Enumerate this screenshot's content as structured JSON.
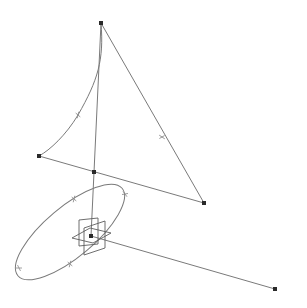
{
  "diagram": {
    "type": "3d-wireframe",
    "width": 307,
    "height": 308,
    "colors": {
      "background": "#ffffff",
      "edge": "#7a7a7a",
      "vertex": "#2a2a2a",
      "gizmo": "#5e5e5e"
    },
    "vertices": [
      {
        "id": "top",
        "x": 101,
        "y": 23
      },
      {
        "id": "left",
        "x": 39,
        "y": 156
      },
      {
        "id": "mid",
        "x": 94,
        "y": 172
      },
      {
        "id": "right",
        "x": 204,
        "y": 203
      },
      {
        "id": "origin",
        "x": 91,
        "y": 236
      },
      {
        "id": "far",
        "x": 275,
        "y": 289
      }
    ],
    "edges": [
      {
        "id": "curve-top-left",
        "d": "M101,23 C104,60 98,80 78,115 C66,135 50,150 39,156"
      },
      {
        "id": "line-top-right",
        "d": "M101,23 L204,203"
      },
      {
        "id": "line-left-right",
        "d": "M39,156 L204,203"
      },
      {
        "id": "line-top-origin",
        "d": "M101,23 L91,236"
      },
      {
        "id": "line-origin-far",
        "d": "M91,236 L275,289"
      }
    ],
    "ellipse": {
      "cx": 70,
      "cy": 232,
      "rx": 68,
      "ry": 25,
      "rotate": -40
    },
    "ticks": [
      {
        "x": 78,
        "y": 115,
        "angle": 40
      },
      {
        "x": 162,
        "y": 137,
        "angle": -30
      },
      {
        "x": 74,
        "y": 199,
        "angle": 40
      },
      {
        "x": 125,
        "y": 194,
        "angle": -10
      },
      {
        "x": 70,
        "y": 264,
        "angle": 40
      },
      {
        "x": 19,
        "y": 268,
        "angle": 0
      }
    ],
    "gizmo": {
      "vertical_square": "M79,220 L98,218 L98,244 L79,246 Z",
      "side_plane": "M84,228 L105,221 L105,248 L84,255 Z",
      "ground_plane": "M72,238 L90,228 L111,233 L93,243 Z"
    }
  }
}
